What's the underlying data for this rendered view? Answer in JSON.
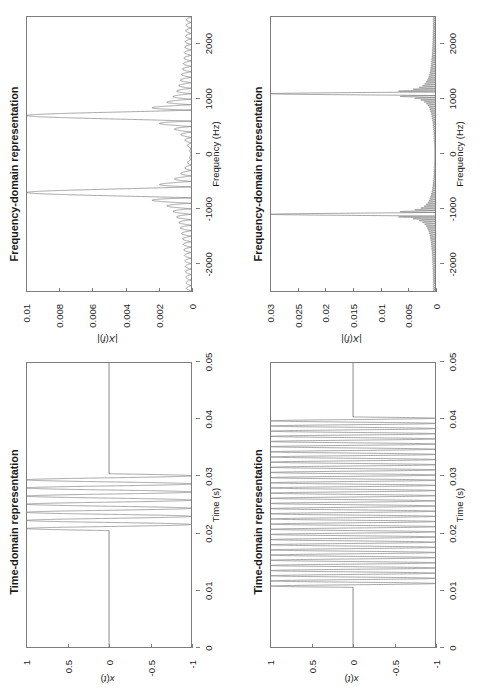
{
  "figure": {
    "orientation": "rotated-90-ccw",
    "line_color": "#808080",
    "axis_color": "#7d7d7d",
    "background": "#ffffff"
  },
  "panels": [
    {
      "id": "time-top",
      "title": "Time-domain representation",
      "xlabel": "Time (s)",
      "ylabel": "x(t)",
      "xticks": [
        "0",
        "0.01",
        "0.02",
        "0.03",
        "0.04",
        "0.05"
      ],
      "yticks": [
        "1",
        "0.5",
        "0",
        "-0.5",
        "-1"
      ]
    },
    {
      "id": "freq-top",
      "title": "Frequency-domain representation",
      "xlabel": "Frequency (Hz)",
      "ylabel": "|X(f)|",
      "xticks": [
        "-2000",
        "-1000",
        "0",
        "1000",
        "2000"
      ],
      "yticks": [
        "0.01",
        "0.008",
        "0.006",
        "0.004",
        "0.002",
        "0"
      ]
    },
    {
      "id": "time-bottom",
      "title": "Time-domain representation",
      "xlabel": "Time (s)",
      "ylabel": "x(t)",
      "xticks": [
        "0",
        "0.01",
        "0.02",
        "0.03",
        "0.04",
        "0.05"
      ],
      "yticks": [
        "1",
        "0.5",
        "0",
        "-0.5",
        "-1"
      ]
    },
    {
      "id": "freq-bottom",
      "title": "Frequency-domain representation",
      "xlabel": "Frequency (Hz)",
      "ylabel": "|X(f)|",
      "xticks": [
        "-2000",
        "-1000",
        "0",
        "1000",
        "2000"
      ],
      "yticks": [
        "0.03",
        "0.025",
        "0.02",
        "0.015",
        "0.01",
        "0.005",
        "0"
      ]
    }
  ],
  "chart_data": [
    {
      "type": "line",
      "id": "time-top",
      "title": "Time-domain representation",
      "xlabel": "Time (s)",
      "ylabel": "x(t)",
      "xlim": [
        0,
        0.05
      ],
      "ylim": [
        -1,
        1
      ],
      "xticks": [
        0,
        0.01,
        0.02,
        0.03,
        0.04,
        0.05
      ],
      "yticks": [
        -1,
        -0.5,
        0,
        0.5,
        1
      ],
      "grid": false,
      "description": "Short sinusoidal burst: zero outside 0.0205-0.0305 s, full-amplitude sinusoid of about 700 Hz inside the burst window.",
      "signal": {
        "waveform": "gated-sine",
        "burst_start_s": 0.0205,
        "burst_end_s": 0.0305,
        "frequency_hz": 700,
        "amplitude": 1
      }
    },
    {
      "type": "line",
      "id": "freq-top",
      "title": "Frequency-domain representation",
      "xlabel": "Frequency (Hz)",
      "ylabel": "|X(f)|",
      "xlim": [
        -2500,
        2500
      ],
      "ylim": [
        0,
        0.01
      ],
      "xticks": [
        -2000,
        -1000,
        0,
        1000,
        2000
      ],
      "yticks": [
        0,
        0.002,
        0.004,
        0.006,
        0.008,
        0.01
      ],
      "grid": false,
      "description": "Magnitude spectrum of the short burst: two broad sinc-shaped lobes centred at about -700 Hz and +700 Hz reaching 0.01, with pronounced ringing side-lobes decaying toward the edges.",
      "peaks": [
        {
          "frequency_hz": -700,
          "magnitude": 0.01
        },
        {
          "frequency_hz": 700,
          "magnitude": 0.01
        }
      ],
      "sidelobe_envelope_peak": 0.0025,
      "mainlobe_half_width_hz": 100
    },
    {
      "type": "line",
      "id": "time-bottom",
      "title": "Time-domain representation",
      "xlabel": "Time (s)",
      "ylabel": "x(t)",
      "xlim": [
        0,
        0.05
      ],
      "ylim": [
        -1,
        1
      ],
      "xticks": [
        0,
        0.01,
        0.02,
        0.03,
        0.04,
        0.05
      ],
      "yticks": [
        -1,
        -0.5,
        0,
        0.5,
        1
      ],
      "grid": false,
      "description": "Long sinusoidal burst: zero outside 0.0105-0.0405 s, full-amplitude sinusoid of about 1100 Hz inside the much wider burst window.",
      "signal": {
        "waveform": "gated-sine",
        "burst_start_s": 0.0105,
        "burst_end_s": 0.0405,
        "frequency_hz": 1100,
        "amplitude": 1
      }
    },
    {
      "type": "line",
      "id": "freq-bottom",
      "title": "Frequency-domain representation",
      "xlabel": "Frequency (Hz)",
      "ylabel": "|X(f)|",
      "xlim": [
        -2500,
        2500
      ],
      "ylim": [
        0,
        0.03
      ],
      "xticks": [
        -2000,
        -1000,
        0,
        1000,
        2000
      ],
      "yticks": [
        0,
        0.005,
        0.01,
        0.015,
        0.02,
        0.025,
        0.03
      ],
      "grid": false,
      "description": "Magnitude spectrum of the long burst: two very narrow sharp spikes at about -1100 Hz and +1100 Hz reaching 0.03, with tight low side-lobes hugging the baseline.",
      "peaks": [
        {
          "frequency_hz": -1100,
          "magnitude": 0.03
        },
        {
          "frequency_hz": 1100,
          "magnitude": 0.03
        }
      ],
      "sidelobe_envelope_peak": 0.004,
      "mainlobe_half_width_hz": 33
    }
  ]
}
